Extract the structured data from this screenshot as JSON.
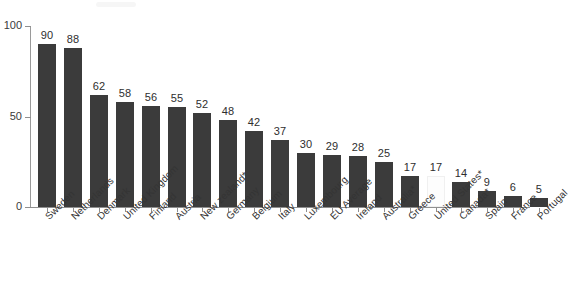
{
  "chart_data": {
    "type": "bar",
    "title": "",
    "subtitle": "",
    "xlabel": "",
    "ylabel": "",
    "ylim": [
      0,
      100
    ],
    "ytick_labels": [
      "0",
      "50",
      "100"
    ],
    "ytick_values": [
      0,
      50,
      100
    ],
    "grid": false,
    "legend": null,
    "orientation": "vertical",
    "bar_color": "#3b3b3b",
    "highlight_color": "#fdfdfd",
    "categories": [
      "Sweden",
      "Netherlands",
      "Denmark",
      "United Kingdom",
      "Finland",
      "Austria",
      "New zealand*",
      "Germany",
      "Belgium",
      "Italy",
      "Luxembourg",
      "EU Average",
      "Ireland",
      "Australia*",
      "Greece",
      "United States*",
      "Canada*",
      "Spain",
      "France",
      "Portugal"
    ],
    "values": [
      90,
      88,
      62,
      58,
      56,
      55,
      52,
      48,
      42,
      37,
      30,
      29,
      28,
      25,
      17,
      17,
      14,
      9,
      6,
      5
    ],
    "value_labels": [
      "90",
      "88",
      "62",
      "58",
      "56",
      "55",
      "52",
      "48",
      "42",
      "37",
      "30",
      "29",
      "28",
      "25",
      "17",
      "17",
      "14",
      "9",
      "6",
      "5"
    ],
    "highlighted_index": 15,
    "highlight_note": "United States* bar drawn unfilled (white)"
  }
}
